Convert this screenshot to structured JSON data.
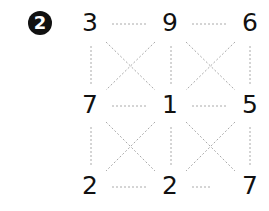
{
  "problem": {
    "badge": "2",
    "grid": [
      [
        "3",
        "9",
        "6"
      ],
      [
        "7",
        "1",
        "5"
      ],
      [
        "2",
        "2",
        "7"
      ]
    ],
    "line_color": "#aaaaaa",
    "text_color": "#111111"
  }
}
